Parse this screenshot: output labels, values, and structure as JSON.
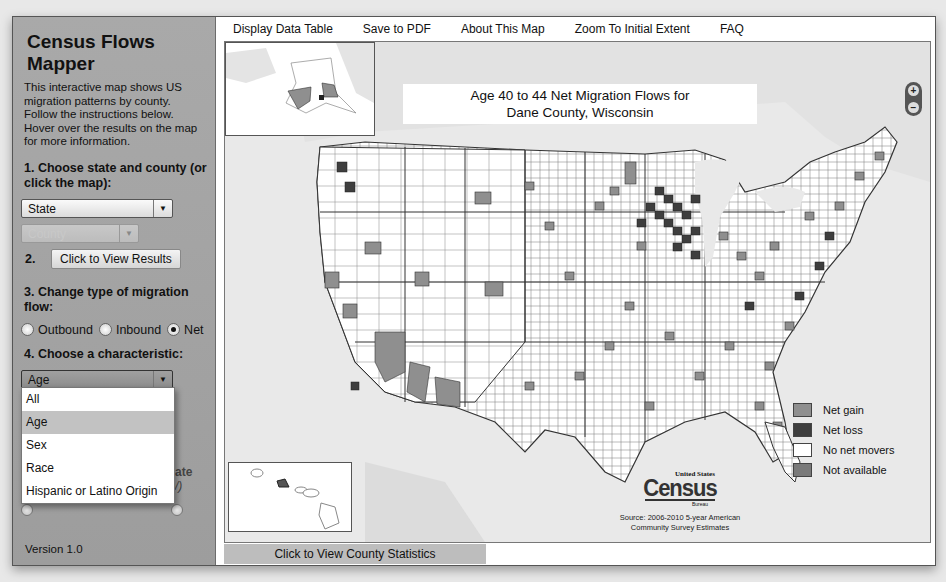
{
  "app": {
    "title": "Census Flows Mapper",
    "intro": "This interactive map shows US migration patterns by county.  Follow the instructions below.  Hover over the results on the map for more information.",
    "version": "Version 1.0"
  },
  "sidebar": {
    "step1": "1. Choose state and county (or click the map):",
    "state_select": {
      "value": "State"
    },
    "county_select": {
      "value": "County"
    },
    "step2_num": "2.",
    "view_results_button": "Click to View Results",
    "step3": "3. Change type of migration flow:",
    "flow_options": [
      {
        "label": "Outbound",
        "checked": false
      },
      {
        "label": "Inbound",
        "checked": false
      },
      {
        "label": "Net",
        "checked": true
      }
    ],
    "step4": "4. Choose a characteristic:",
    "characteristic_select": {
      "value": "Age"
    },
    "characteristic_options": [
      {
        "label": "All",
        "selected": false
      },
      {
        "label": "Age",
        "selected": true
      },
      {
        "label": "Sex",
        "selected": false
      },
      {
        "label": "Race",
        "selected": false
      },
      {
        "label": "Hispanic or Latino Origin",
        "selected": false
      }
    ],
    "hidden_partial_text_1": "ate",
    "hidden_partial_text_2": "/)"
  },
  "toolbar": {
    "links": [
      "Display Data Table",
      "Save to PDF",
      "About This Map",
      "Zoom To Initial Extent",
      "FAQ"
    ]
  },
  "map": {
    "title_line1": "Age 40 to 44 Net Migration Flows for",
    "title_line2": "Dane County, Wisconsin",
    "zoom_in": "+",
    "zoom_out": "−",
    "legend": [
      {
        "label": "Net gain",
        "color": "#8f8f8f"
      },
      {
        "label": "Net loss",
        "color": "#3e3e3e"
      },
      {
        "label": "No net movers",
        "color": "#ffffff"
      },
      {
        "label": "Not available",
        "color": "#7a7a7a"
      }
    ],
    "census_logo": {
      "top": "United States",
      "main": "Census",
      "bottom": "Bureau"
    },
    "source_line1": "Source: 2006-2010 5-year American",
    "source_line2": "Community Survey Estimates",
    "colors": {
      "gain": "#8f8f8f",
      "loss": "#3e3e3e",
      "none": "#ffffff",
      "background": "#e9e9e9"
    }
  },
  "bottom": {
    "county_stats_button": "Click to View County Statistics"
  }
}
